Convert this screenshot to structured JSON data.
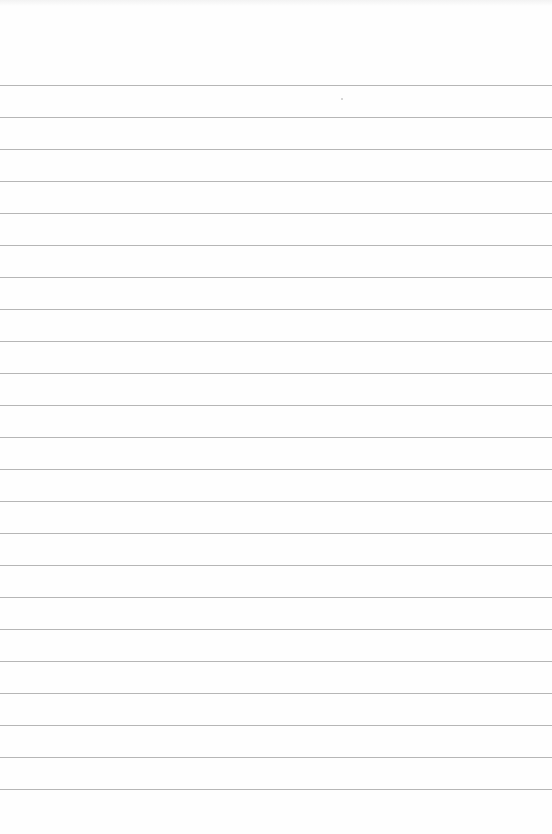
{
  "page": {
    "type": "lined-notepaper",
    "background_color": "#fefefe",
    "line_color": "#a9a9a9",
    "line_count": 23,
    "first_line_y": 85,
    "line_spacing_px": 32,
    "text_content": []
  }
}
